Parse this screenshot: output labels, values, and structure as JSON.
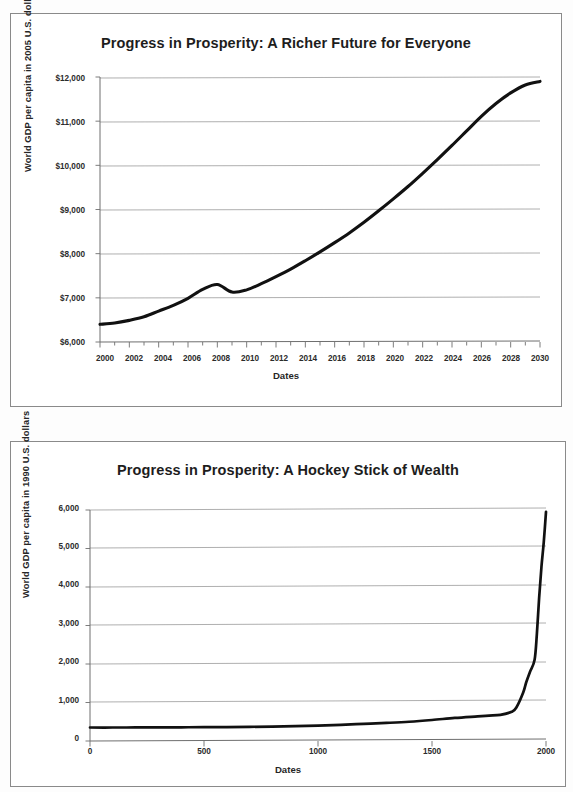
{
  "document": {
    "kind": "scanned-document-page",
    "figure_count": 2
  },
  "figures": [
    {
      "id": "figure-1",
      "title": "Progress in Prosperity: A Richer Future for Everyone",
      "x_axis_title": "Dates",
      "y_axis_title": "World GDP per capita in 2005 U.S. dollars",
      "y_tick_labels": [
        "$12,000",
        "$11,000",
        "$10,000",
        "$9,000",
        "$8,000",
        "$7,000",
        "$6,000"
      ],
      "x_tick_labels": [
        "2000",
        "2002",
        "2004",
        "2006",
        "2008",
        "2010",
        "2012",
        "2014",
        "2016",
        "2018",
        "2020",
        "2022",
        "2024",
        "2026",
        "2028",
        "2030"
      ]
    },
    {
      "id": "figure-2",
      "title": "Progress in Prosperity: A Hockey Stick of Wealth",
      "x_axis_title": "Dates",
      "y_axis_title": "World GDP per capita in 1990 U.S. dollars",
      "y_tick_labels": [
        "6,000",
        "5,000",
        "4,000",
        "3,000",
        "2,000",
        "1,000",
        "0"
      ],
      "x_tick_labels": [
        "0",
        "500",
        "1000",
        "1500",
        "2000"
      ]
    }
  ],
  "chart_data": [
    {
      "type": "line",
      "title": "Progress in Prosperity: A Richer Future for Everyone",
      "xlabel": "Dates",
      "ylabel": "World GDP per capita in 2005 U.S. dollars",
      "xlim": [
        2000,
        2030
      ],
      "ylim": [
        6000,
        12000
      ],
      "yticks": [
        6000,
        7000,
        8000,
        9000,
        10000,
        11000,
        12000
      ],
      "xticks": [
        2000,
        2002,
        2004,
        2006,
        2008,
        2010,
        2012,
        2014,
        2016,
        2018,
        2020,
        2022,
        2024,
        2026,
        2028,
        2030
      ],
      "minor_xtick_interval": 1,
      "grid": "horizontal",
      "legend": "none",
      "series": [
        {
          "name": "World GDP per capita (2005 US$)",
          "x": [
            2000,
            2001,
            2002,
            2003,
            2004,
            2005,
            2006,
            2007,
            2008,
            2009,
            2010,
            2011,
            2012,
            2013,
            2014,
            2015,
            2016,
            2017,
            2018,
            2019,
            2020,
            2021,
            2022,
            2023,
            2024,
            2025,
            2026,
            2027,
            2028,
            2029,
            2030
          ],
          "y": [
            6400,
            6430,
            6490,
            6570,
            6700,
            6830,
            6990,
            7190,
            7300,
            7130,
            7180,
            7320,
            7480,
            7650,
            7840,
            8040,
            8250,
            8470,
            8710,
            8970,
            9240,
            9520,
            9820,
            10130,
            10450,
            10780,
            11110,
            11400,
            11640,
            11820,
            11900
          ]
        }
      ]
    },
    {
      "type": "line",
      "title": "Progress in Prosperity: A Hockey Stick of Wealth",
      "xlabel": "Dates",
      "ylabel": "World GDP per capita in 1990 U.S. dollars",
      "xlim": [
        0,
        2000
      ],
      "ylim": [
        0,
        6000
      ],
      "yticks": [
        0,
        1000,
        2000,
        3000,
        4000,
        5000,
        6000
      ],
      "xticks": [
        0,
        500,
        1000,
        1500,
        2000
      ],
      "grid": "horizontal",
      "legend": "none",
      "series": [
        {
          "name": "World GDP per capita (1990 US$)",
          "x": [
            0,
            100,
            200,
            300,
            400,
            500,
            600,
            700,
            800,
            900,
            1000,
            1100,
            1200,
            1300,
            1400,
            1500,
            1600,
            1700,
            1750,
            1800,
            1850,
            1870,
            1900,
            1913,
            1930,
            1950,
            1960,
            1970,
            1980,
            1990,
            2000
          ],
          "y": [
            350,
            350,
            352,
            354,
            356,
            358,
            362,
            368,
            375,
            385,
            400,
            420,
            445,
            470,
            500,
            545,
            600,
            640,
            660,
            680,
            760,
            870,
            1260,
            1520,
            1800,
            2110,
            2780,
            3730,
            4520,
            5150,
            5950
          ]
        }
      ]
    }
  ]
}
